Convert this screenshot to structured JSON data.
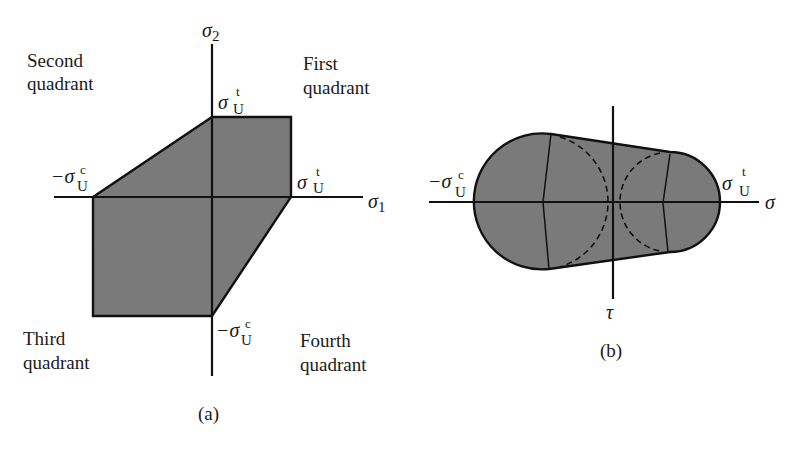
{
  "figure": {
    "panel_a": {
      "caption": "(a)",
      "axes": {
        "x_label_symbol": "σ",
        "x_label_subscript": "1",
        "y_label_symbol": "σ",
        "y_label_subscript": "2"
      },
      "quadrants": {
        "first": [
          "First",
          "quadrant"
        ],
        "second": [
          "Second",
          "quadrant"
        ],
        "third": [
          "Third",
          "quadrant"
        ],
        "fourth": [
          "Fourth",
          "quadrant"
        ]
      },
      "tick_labels": {
        "y_top": {
          "symbol": "σ",
          "sup": "t",
          "sub": "U"
        },
        "x_right": {
          "symbol": "σ",
          "sup": "t",
          "sub": "U"
        },
        "x_left": {
          "symbol": "−σ",
          "sup": "c",
          "sub": "U"
        },
        "y_bottom": {
          "symbol": "−σ",
          "sup": "c",
          "sub": "U"
        }
      },
      "fill_color": "#7a7a7a",
      "polygon_vertices": [
        [
          "-σUc",
          0
        ],
        [
          0,
          "σUt"
        ],
        [
          "σUt",
          "σUt"
        ],
        [
          "σUt",
          0
        ],
        [
          0,
          "-σUc"
        ],
        [
          "-σUc",
          "-σUc"
        ]
      ]
    },
    "panel_b": {
      "caption": "(b)",
      "axes": {
        "x_label": "σ",
        "y_label": "τ"
      },
      "tick_labels": {
        "left": {
          "symbol": "−σ",
          "sup": "c",
          "sub": "U"
        },
        "right": {
          "symbol": "σ",
          "sup": "t",
          "sub": "U"
        }
      },
      "fill_color": "#7a7a7a",
      "circles": [
        "compression Mohr circle (dashed)",
        "tension Mohr circle (dashed)"
      ]
    }
  }
}
